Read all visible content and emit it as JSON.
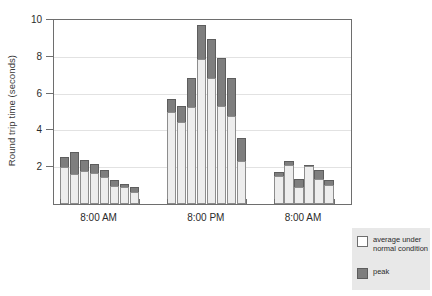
{
  "chart_data": {
    "type": "bar",
    "title": "",
    "subtitle": "",
    "xlabel": "",
    "ylabel": "Round trip time (seconds)",
    "ylim": [
      0,
      10
    ],
    "yticks": [
      2,
      4,
      6,
      8,
      10
    ],
    "grid": true,
    "stacked": true,
    "legend_position": "outside-bottom-right",
    "group_labels": [
      "8:00 AM",
      "8:00 PM",
      "8:00 AM"
    ],
    "series": [
      {
        "name": "average under normal condition",
        "color": "#ededed"
      },
      {
        "name": "peak",
        "color": "#7e7e7e"
      }
    ],
    "groups": [
      {
        "label": "8:00 AM",
        "bars": [
          {
            "average": 2.0,
            "peak": 2.55
          },
          {
            "average": 1.65,
            "peak": 2.8
          },
          {
            "average": 1.8,
            "peak": 2.4
          },
          {
            "average": 1.7,
            "peak": 2.15
          },
          {
            "average": 1.45,
            "peak": 1.85
          },
          {
            "average": 1.0,
            "peak": 1.3
          },
          {
            "average": 0.95,
            "peak": 1.1
          },
          {
            "average": 0.65,
            "peak": 0.9
          }
        ]
      },
      {
        "label": "8:00 PM",
        "bars": [
          {
            "average": 5.0,
            "peak": 5.7
          },
          {
            "average": 4.45,
            "peak": 5.3
          },
          {
            "average": 5.25,
            "peak": 6.85
          },
          {
            "average": 7.9,
            "peak": 9.75
          },
          {
            "average": 6.85,
            "peak": 8.95
          },
          {
            "average": 5.3,
            "peak": 7.95
          },
          {
            "average": 4.8,
            "peak": 6.85
          },
          {
            "average": 2.35,
            "peak": 3.6
          }
        ]
      },
      {
        "label": "8:00 AM",
        "bars": [
          {
            "average": 1.5,
            "peak": 1.75
          },
          {
            "average": 2.1,
            "peak": 2.35
          },
          {
            "average": 0.9,
            "peak": 1.35
          },
          {
            "average": 2.05,
            "peak": 2.1
          },
          {
            "average": 1.35,
            "peak": 1.85
          },
          {
            "average": 1.05,
            "peak": 1.3
          }
        ]
      }
    ]
  },
  "legend": {
    "normal_label": "average under normal condition",
    "peak_label": "peak"
  },
  "colors": {
    "average_fill": "#ededed",
    "average_edge": "#8d8d8d",
    "peak_fill": "#7e7e7e",
    "peak_edge": "#5d5d5d",
    "axis": "#6e6e6e",
    "grid": "#e2e2e2",
    "legend_bg": "#e8e8e8",
    "background": "#ffffff"
  }
}
